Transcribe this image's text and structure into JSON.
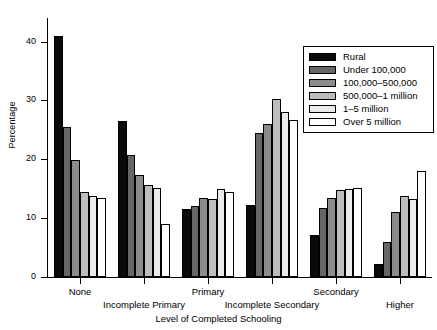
{
  "chart_data": {
    "type": "bar",
    "title": "",
    "xlabel": "Level of Completed Schooling",
    "ylabel": "Percentage",
    "ylim": [
      0,
      44
    ],
    "yticks": [
      0,
      10,
      20,
      30,
      40
    ],
    "ytick_labels": [
      "0",
      "10",
      "20",
      "30",
      "40"
    ],
    "grid": false,
    "legend_position": "top-right",
    "categories": [
      "None",
      "Incomplete Primary",
      "Primary",
      "Incomplete Secondary",
      "Secondary",
      "Higher"
    ],
    "series": [
      {
        "name": "Rural",
        "color": "#0a0a0a",
        "values": [
          41.0,
          26.5,
          11.5,
          12.3,
          7.2,
          2.2
        ]
      },
      {
        "name": "Under 100,000",
        "color": "#666666",
        "values": [
          25.5,
          20.8,
          12.0,
          24.5,
          11.8,
          6.0
        ]
      },
      {
        "name": "100,000–500,000",
        "color": "#8c8c8c",
        "values": [
          19.8,
          17.3,
          13.5,
          26.0,
          13.5,
          11.0
        ]
      },
      {
        "name": "500,000–1 million",
        "color": "#bdbdbd",
        "values": [
          14.5,
          15.6,
          13.2,
          30.2,
          14.8,
          13.8
        ]
      },
      {
        "name": "1–5 million",
        "color": "#ebebeb",
        "values": [
          13.8,
          15.2,
          15.0,
          28.0,
          15.0,
          13.2
        ]
      },
      {
        "name": "Over 5 million",
        "color": "#ffffff",
        "values": [
          13.5,
          9.0,
          14.5,
          26.6,
          15.2,
          18.0
        ]
      }
    ]
  },
  "legend": {
    "items": [
      {
        "label": "Rural"
      },
      {
        "label": "Under 100,000"
      },
      {
        "label": "100,000–500,000"
      },
      {
        "label": "500,000–1 million"
      },
      {
        "label": "1–5 million"
      },
      {
        "label": "Over 5 million"
      }
    ]
  }
}
